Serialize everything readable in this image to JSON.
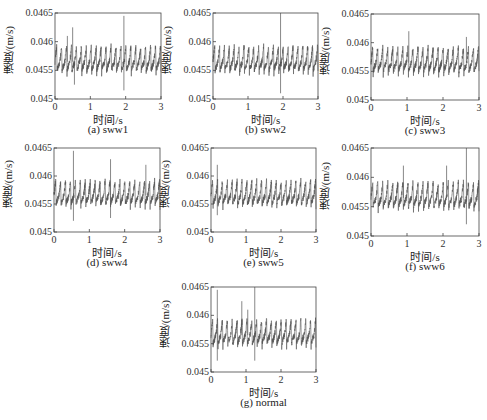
{
  "figure": {
    "y_label": "速度/(m/s)",
    "x_label": "时间/s",
    "panels": [
      {
        "id": "a",
        "caption": "(a) sww1",
        "box": [
          55,
          13,
          161,
          99
        ]
      },
      {
        "id": "b",
        "caption": "(b) sww2",
        "box": [
          213,
          13,
          318,
          99
        ]
      },
      {
        "id": "c",
        "caption": "(c) sww3",
        "box": [
          371,
          14,
          479,
          100
        ]
      },
      {
        "id": "d",
        "caption": "(d) sww4",
        "box": [
          54,
          148,
          160,
          232
        ]
      },
      {
        "id": "e",
        "caption": "(e) sww5",
        "box": [
          211,
          148,
          316,
          232
        ]
      },
      {
        "id": "f",
        "caption": "(f) sww6",
        "box": [
          371,
          148,
          479,
          236
        ]
      },
      {
        "id": "g",
        "caption": "(g) normal",
        "box": [
          211,
          287,
          316,
          372
        ]
      }
    ]
  },
  "chart_data": [
    {
      "type": "line",
      "title": "(a) sww1",
      "xlabel": "时间/s",
      "ylabel": "速度/(m/s)",
      "xlim": [
        0,
        3
      ],
      "ylim": [
        0.045,
        0.0465
      ],
      "xticks": [
        0,
        1,
        2,
        3
      ],
      "yticks": [
        0.045,
        0.0455,
        0.046,
        0.0465
      ],
      "series": [
        {
          "name": "sww1",
          "baseline": 0.04565,
          "amplitude": 0.0003,
          "period_s": 0.14,
          "spikes": [
            {
              "x": 0.35,
              "y": 0.0461
            },
            {
              "x": 0.5,
              "y": 0.04625
            },
            {
              "x": 0.55,
              "y": 0.04525
            },
            {
              "x": 1.95,
              "y": 0.04645
            },
            {
              "x": 1.95,
              "y": 0.04515
            }
          ]
        }
      ]
    },
    {
      "type": "line",
      "title": "(b) sww2",
      "xlabel": "时间/s",
      "ylabel": "速度/(m/s)",
      "xlim": [
        0,
        3
      ],
      "ylim": [
        0.045,
        0.0465
      ],
      "xticks": [
        0,
        1,
        2,
        3
      ],
      "yticks": [
        0.045,
        0.0455,
        0.046,
        0.0465
      ],
      "series": [
        {
          "name": "sww2",
          "baseline": 0.04565,
          "amplitude": 0.0003,
          "period_s": 0.14,
          "spikes": [
            {
              "x": 1.93,
              "y": 0.0465
            },
            {
              "x": 1.93,
              "y": 0.0451
            }
          ]
        }
      ]
    },
    {
      "type": "line",
      "title": "(c) sww3",
      "xlabel": "时间/s",
      "ylabel": "速度/(m/s)",
      "xlim": [
        0,
        3
      ],
      "ylim": [
        0.045,
        0.0465
      ],
      "xticks": [
        0,
        1,
        2,
        3
      ],
      "yticks": [
        0.045,
        0.0455,
        0.046,
        0.0465
      ],
      "series": [
        {
          "name": "sww3",
          "baseline": 0.04565,
          "amplitude": 0.0003,
          "period_s": 0.14,
          "spikes": [
            {
              "x": 1.05,
              "y": 0.0462
            },
            {
              "x": 2.65,
              "y": 0.0461
            }
          ]
        }
      ]
    },
    {
      "type": "line",
      "title": "(d) sww4",
      "xlabel": "时间/s",
      "ylabel": "速度/(m/s)",
      "xlim": [
        0,
        3
      ],
      "ylim": [
        0.045,
        0.0465
      ],
      "xticks": [
        0,
        1,
        2,
        3
      ],
      "yticks": [
        0.045,
        0.0455,
        0.046,
        0.0465
      ],
      "series": [
        {
          "name": "sww4",
          "baseline": 0.04565,
          "amplitude": 0.0003,
          "period_s": 0.14,
          "spikes": [
            {
              "x": 0.55,
              "y": 0.04645
            },
            {
              "x": 0.55,
              "y": 0.0452
            },
            {
              "x": 1.6,
              "y": 0.0463
            },
            {
              "x": 1.6,
              "y": 0.04525
            },
            {
              "x": 2.6,
              "y": 0.0462
            }
          ]
        }
      ]
    },
    {
      "type": "line",
      "title": "(e) sww5",
      "xlabel": "时间/s",
      "ylabel": "速度/(m/s)",
      "xlim": [
        0,
        3
      ],
      "ylim": [
        0.045,
        0.0465
      ],
      "xticks": [
        0,
        1,
        2,
        3
      ],
      "yticks": [
        0.045,
        0.0455,
        0.046,
        0.0465
      ],
      "series": [
        {
          "name": "sww5",
          "baseline": 0.04565,
          "amplitude": 0.0003,
          "period_s": 0.14,
          "spikes": [
            {
              "x": 0.18,
              "y": 0.0462
            },
            {
              "x": 0.18,
              "y": 0.0453
            }
          ]
        }
      ]
    },
    {
      "type": "line",
      "title": "(f) sww6",
      "xlabel": "时间/s",
      "ylabel": "速度/(m/s)",
      "xlim": [
        0,
        3
      ],
      "ylim": [
        0.045,
        0.0465
      ],
      "xticks": [
        0,
        1,
        2,
        3
      ],
      "yticks": [
        0.045,
        0.0455,
        0.046,
        0.0465
      ],
      "series": [
        {
          "name": "sww6",
          "baseline": 0.04565,
          "amplitude": 0.0003,
          "period_s": 0.14,
          "spikes": [
            {
              "x": 0.9,
              "y": 0.0462
            },
            {
              "x": 2.1,
              "y": 0.0462
            },
            {
              "x": 2.65,
              "y": 0.0465
            },
            {
              "x": 2.65,
              "y": 0.0452
            }
          ]
        }
      ]
    },
    {
      "type": "line",
      "title": "(g) normal",
      "xlabel": "时间/s",
      "ylabel": "速度/(m/s)",
      "xlim": [
        0,
        3
      ],
      "ylim": [
        0.045,
        0.0465
      ],
      "xticks": [
        0,
        1,
        2,
        3
      ],
      "yticks": [
        0.045,
        0.0455,
        0.046,
        0.0465
      ],
      "series": [
        {
          "name": "normal",
          "baseline": 0.04565,
          "amplitude": 0.0003,
          "period_s": 0.14,
          "spikes": [
            {
              "x": 0.18,
              "y": 0.04645
            },
            {
              "x": 0.18,
              "y": 0.0452
            },
            {
              "x": 0.88,
              "y": 0.04625
            },
            {
              "x": 1.05,
              "y": 0.0461
            },
            {
              "x": 1.25,
              "y": 0.0465
            },
            {
              "x": 1.25,
              "y": 0.0452
            }
          ]
        }
      ]
    }
  ]
}
